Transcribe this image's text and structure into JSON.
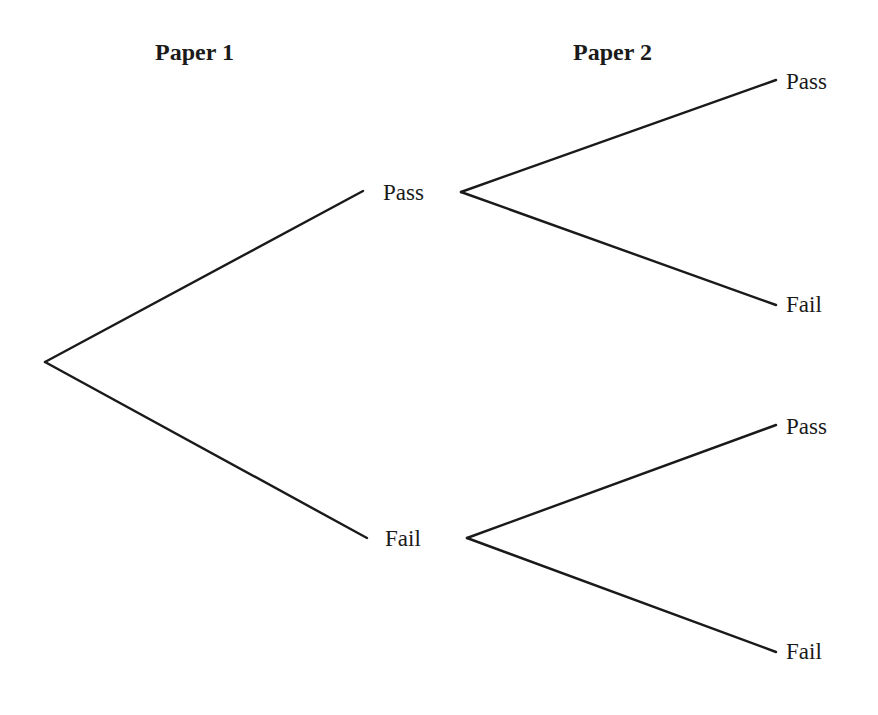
{
  "headers": {
    "paper1": "Paper 1",
    "paper2": "Paper 2"
  },
  "tree": {
    "level1": [
      {
        "label": "Pass"
      },
      {
        "label": "Fail"
      }
    ],
    "level2": [
      {
        "parent": "Pass",
        "label": "Pass"
      },
      {
        "parent": "Pass",
        "label": "Fail"
      },
      {
        "parent": "Fail",
        "label": "Pass"
      },
      {
        "parent": "Fail",
        "label": "Fail"
      }
    ]
  },
  "colors": {
    "line": "#1a1a1a",
    "text": "#1a1a1a",
    "background": "#ffffff"
  }
}
